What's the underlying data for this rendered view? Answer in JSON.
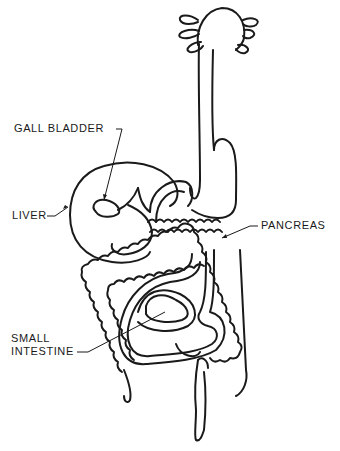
{
  "diagram": {
    "style": "black line drawing on white",
    "colors": {
      "background": "#ffffff",
      "ink": "#1a1a1a"
    },
    "labels": [
      {
        "id": "gall_bladder",
        "text": "GALL BLADDER"
      },
      {
        "id": "liver",
        "text": "LIVER"
      },
      {
        "id": "pancreas",
        "text": "PANCREAS"
      },
      {
        "id": "small_intestine_1",
        "text": "SMALL"
      },
      {
        "id": "small_intestine_2",
        "text": "INTESTINE"
      }
    ]
  }
}
